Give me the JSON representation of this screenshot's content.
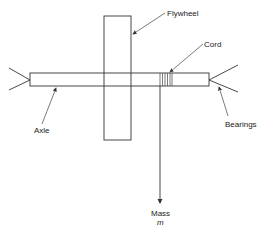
{
  "diagram": {
    "labels": {
      "flywheel": "Flywheel",
      "cord": "Cord",
      "axle": "Axle",
      "bearings": "Bearings",
      "mass": "Mass",
      "mass_symbol": "m"
    },
    "colors": {
      "line": "#333333",
      "background": "#ffffff"
    }
  }
}
